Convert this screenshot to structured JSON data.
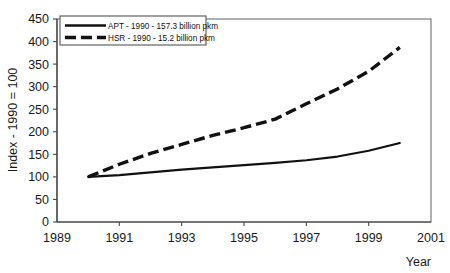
{
  "chart_data": {
    "type": "line",
    "title": "",
    "xlabel": "Year",
    "ylabel": "Index - 1990 = 100",
    "xlim": [
      1989,
      2001
    ],
    "ylim": [
      0,
      450
    ],
    "grid": false,
    "legend_position": "top-left-inside",
    "x_ticks": [
      "1989",
      "1991",
      "1993",
      "1995",
      "1997",
      "1999",
      "2001"
    ],
    "x_tick_values": [
      1989,
      1991,
      1993,
      1995,
      1997,
      1999,
      2001
    ],
    "y_ticks": [
      "0",
      "50",
      "100",
      "150",
      "200",
      "250",
      "300",
      "350",
      "400",
      "450"
    ],
    "y_tick_values": [
      0,
      50,
      100,
      150,
      200,
      250,
      300,
      350,
      400,
      450
    ],
    "x": [
      1990,
      1991,
      1992,
      1993,
      1994,
      1995,
      1996,
      1997,
      1998,
      1999,
      2000
    ],
    "series": [
      {
        "name": "APT - 1990 - 157.3 billion pkm",
        "short_name": "APT",
        "style": "solid",
        "values": [
          100,
          104,
          110,
          116,
          121,
          126,
          131,
          137,
          145,
          158,
          175
        ]
      },
      {
        "name": "HSR - 1990 - 15.2 billion pkm",
        "short_name": "HSR",
        "style": "dashed",
        "values": [
          100,
          128,
          152,
          172,
          192,
          209,
          228,
          262,
          295,
          334,
          387
        ]
      }
    ],
    "legend": [
      "APT - 1990 - 157.3 billion pkm",
      "HSR - 1990 - 15.2 billion pkm"
    ]
  },
  "colors": {
    "series_stroke": "#111111",
    "axis": "#3a3a3a",
    "frame": "#6f6f6f",
    "text": "#1a1a1a",
    "background": "#ffffff"
  }
}
